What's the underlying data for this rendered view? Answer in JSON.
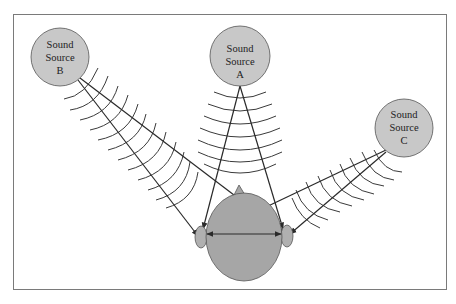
{
  "diagram": {
    "colors": {
      "background": "#ffffff",
      "frame": "#7a7a7a",
      "source_fill": "#c8c8c8",
      "source_stroke": "#555555",
      "head_fill": "#a6a6a6",
      "head_stroke": "#555555",
      "line": "#2a2a2a",
      "wave": "#3a3a3a"
    },
    "sources": [
      {
        "id": "B",
        "line1": "Sound",
        "line2": "Source",
        "line3": "B",
        "cx": 60,
        "cy": 57,
        "r": 29
      },
      {
        "id": "A",
        "line1": "Sound",
        "line2": "Source",
        "line3": "A",
        "cx": 240,
        "cy": 55,
        "r": 30
      },
      {
        "id": "C",
        "line1": "Sound",
        "line2": "Source",
        "line3": "C",
        "cx": 404,
        "cy": 130,
        "r": 29
      }
    ],
    "head": {
      "cx": 244,
      "cy": 237,
      "rx": 38,
      "ry": 44
    },
    "ears": {
      "left": {
        "cx": 201,
        "cy": 237
      },
      "right": {
        "cx": 287,
        "cy": 236
      }
    },
    "interaural_arrow": {
      "x1": 205,
      "y1": 234,
      "x2": 283,
      "y2": 234
    }
  }
}
